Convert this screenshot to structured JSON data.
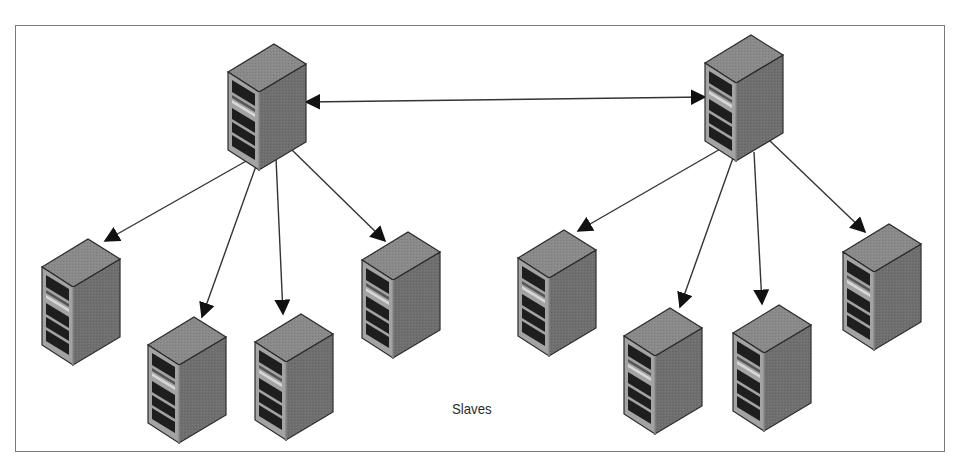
{
  "diagram": {
    "type": "master-slave replication topology",
    "colors": {
      "frame": "#7a7a7a",
      "server_top": "#8c8c8c",
      "server_left": "#9a9a9a",
      "server_right": "#6e6e6e",
      "server_slot": "#1e1e1e",
      "server_stripe": "#d0d0d0",
      "arrow": "#333333",
      "label_text": "#2b2b2b"
    },
    "masters": [
      {
        "id": "master-left",
        "x": 228,
        "y": 42
      },
      {
        "id": "master-right",
        "x": 705,
        "y": 33
      }
    ],
    "slaves": [
      {
        "id": "slave-1",
        "x": 42,
        "y": 237,
        "master": "master-left"
      },
      {
        "id": "slave-2",
        "x": 148,
        "y": 315,
        "master": "master-left"
      },
      {
        "id": "slave-3",
        "x": 255,
        "y": 312,
        "master": "master-left"
      },
      {
        "id": "slave-4",
        "x": 362,
        "y": 230,
        "master": "master-left"
      },
      {
        "id": "slave-5",
        "x": 518,
        "y": 228,
        "master": "master-right"
      },
      {
        "id": "slave-6",
        "x": 624,
        "y": 306,
        "master": "master-right"
      },
      {
        "id": "slave-7",
        "x": 733,
        "y": 303,
        "master": "master-right"
      },
      {
        "id": "slave-8",
        "x": 843,
        "y": 222,
        "master": "master-right"
      }
    ],
    "edges": [
      {
        "from": "master-left",
        "to": "master-right",
        "bidirectional": true,
        "x1": 306,
        "y1": 102,
        "x2": 705,
        "y2": 97
      },
      {
        "from": "master-left",
        "to": "slave-1",
        "x1": 248,
        "y1": 160,
        "x2": 105,
        "y2": 241
      },
      {
        "from": "master-left",
        "to": "slave-2",
        "x1": 256,
        "y1": 166,
        "x2": 202,
        "y2": 317
      },
      {
        "from": "master-left",
        "to": "slave-3",
        "x1": 276,
        "y1": 158,
        "x2": 283,
        "y2": 314
      },
      {
        "from": "master-left",
        "to": "slave-4",
        "x1": 292,
        "y1": 150,
        "x2": 385,
        "y2": 241
      },
      {
        "from": "master-right",
        "to": "slave-5",
        "x1": 722,
        "y1": 148,
        "x2": 578,
        "y2": 231
      },
      {
        "from": "master-right",
        "to": "slave-6",
        "x1": 733,
        "y1": 158,
        "x2": 680,
        "y2": 307
      },
      {
        "from": "master-right",
        "to": "slave-7",
        "x1": 754,
        "y1": 152,
        "x2": 762,
        "y2": 304
      },
      {
        "from": "master-right",
        "to": "slave-8",
        "x1": 769,
        "y1": 140,
        "x2": 865,
        "y2": 232
      }
    ],
    "labels": {
      "slaves": "Slaves"
    }
  }
}
